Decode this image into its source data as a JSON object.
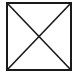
{
  "image": {
    "kind": "placeholder-box",
    "icon": "crossed-box-icon",
    "stroke_color": "#1a1a1a",
    "background_color": "#ffffff"
  }
}
